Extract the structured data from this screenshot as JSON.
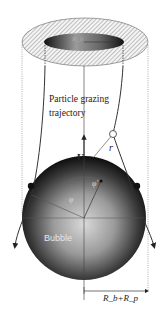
{
  "figure": {
    "type": "schematic",
    "labels": {
      "trajectory": "Particle grazing trajectory",
      "velocity": "U",
      "radial_distance": "r",
      "angle": "φ",
      "angle_prime": "φ'",
      "bubble": "Bubble",
      "measurement": "R_b+R_p",
      "inner_radius": "R_b"
    },
    "colors": {
      "line": "#333333",
      "hatch": "#8a8a8a",
      "bubble_dark": "#111111",
      "bubble_light": "#d8d8d8",
      "background": "#ffffff"
    }
  }
}
